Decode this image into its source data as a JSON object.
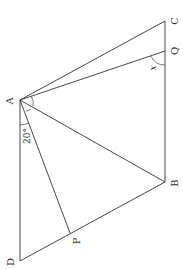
{
  "figure": {
    "type": "geometry",
    "points": {
      "A": {
        "label": "A",
        "x": 20,
        "y": 100
      },
      "B": {
        "label": "B",
        "x": 165,
        "y": 182
      },
      "C": {
        "label": "C",
        "x": 165,
        "y": 21
      },
      "D": {
        "label": "D",
        "x": 20,
        "y": 261
      },
      "P": {
        "label": "P",
        "x": 70,
        "y": 233
      },
      "Q": {
        "label": "Q",
        "x": 165,
        "y": 51
      }
    },
    "segments": [
      "AC",
      "AQ",
      "AB",
      "AP",
      "AD",
      "CB",
      "BD"
    ],
    "angle_labels": {
      "DAP": "20°",
      "AQB": "x"
    }
  }
}
